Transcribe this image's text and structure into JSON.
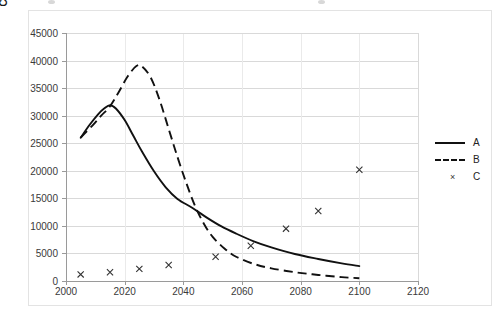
{
  "chart_data": {
    "type": "line",
    "title": "",
    "xlabel": "",
    "ylabel": "CO2 emissions (Mton/annum)",
    "ylabel_parts": {
      "pre": "CO",
      "sub": "2",
      "post": " emissions (Mton/annum)"
    },
    "xlim": [
      2000,
      2120
    ],
    "ylim": [
      0,
      45000
    ],
    "xticks": [
      2000,
      2020,
      2040,
      2060,
      2080,
      2100,
      2120
    ],
    "yticks": [
      0,
      5000,
      10000,
      15000,
      20000,
      25000,
      30000,
      35000,
      40000,
      45000
    ],
    "grid": "horizontal",
    "legend_position": "right",
    "series": [
      {
        "name": "A",
        "style": "solid",
        "points": [
          [
            2005,
            26000
          ],
          [
            2008,
            28300
          ],
          [
            2011,
            30300
          ],
          [
            2013,
            31300
          ],
          [
            2015,
            31900
          ],
          [
            2017,
            31300
          ],
          [
            2020,
            29200
          ],
          [
            2023,
            26300
          ],
          [
            2026,
            23400
          ],
          [
            2030,
            19900
          ],
          [
            2034,
            17000
          ],
          [
            2038,
            14900
          ],
          [
            2043,
            13300
          ],
          [
            2048,
            11500
          ],
          [
            2053,
            9900
          ],
          [
            2058,
            8600
          ],
          [
            2064,
            7200
          ],
          [
            2070,
            6100
          ],
          [
            2078,
            4900
          ],
          [
            2086,
            4000
          ],
          [
            2094,
            3200
          ],
          [
            2100,
            2700
          ]
        ]
      },
      {
        "name": "B",
        "style": "dashed",
        "points": [
          [
            2005,
            26000
          ],
          [
            2009,
            28200
          ],
          [
            2012,
            30000
          ],
          [
            2015,
            31700
          ],
          [
            2018,
            34300
          ],
          [
            2021,
            37100
          ],
          [
            2024,
            39000
          ],
          [
            2026,
            38900
          ],
          [
            2029,
            36800
          ],
          [
            2032,
            32700
          ],
          [
            2035,
            27600
          ],
          [
            2038,
            22500
          ],
          [
            2041,
            17800
          ],
          [
            2044,
            13600
          ],
          [
            2047,
            10400
          ],
          [
            2050,
            8000
          ],
          [
            2054,
            5900
          ],
          [
            2058,
            4400
          ],
          [
            2064,
            3100
          ],
          [
            2070,
            2300
          ],
          [
            2078,
            1600
          ],
          [
            2086,
            1100
          ],
          [
            2094,
            700
          ],
          [
            2100,
            500
          ]
        ]
      },
      {
        "name": "C",
        "style": "markers",
        "marker": "x",
        "points": [
          [
            2005,
            1200
          ],
          [
            2015,
            1600
          ],
          [
            2025,
            2200
          ],
          [
            2035,
            2900
          ],
          [
            2051,
            4400
          ],
          [
            2063,
            6400
          ],
          [
            2075,
            9500
          ],
          [
            2086,
            12700
          ],
          [
            2100,
            20200
          ]
        ]
      }
    ]
  },
  "legend": {
    "items": [
      {
        "label": "A",
        "style": "solid"
      },
      {
        "label": "B",
        "style": "dashed"
      },
      {
        "label": "C",
        "style": "marker"
      }
    ]
  },
  "colors": {
    "line": "#111111",
    "grid": "#d9d9d9",
    "axis": "#9a9a9a",
    "text": "#3a3a3a",
    "background": "#ffffff",
    "frame": "#e3e3e3"
  }
}
